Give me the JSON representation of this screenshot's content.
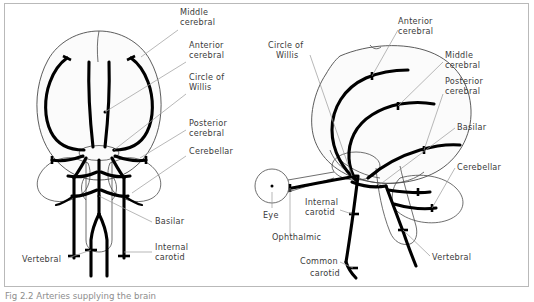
{
  "figure": {
    "caption": "Fig 2.2 Arteries supplying the brain",
    "frame_color": "#b9b9b9",
    "vessel_color": "#000000",
    "outline_color": "#4a4a4a",
    "leader_color": "#9a9a9a",
    "label_color": "#3a3a3a",
    "background": "#ffffff"
  },
  "left_diagram": {
    "name": "anterior-view-brain",
    "labels": [
      {
        "id": "middle-cerebral",
        "line1": "Middle",
        "line2": "cerebral"
      },
      {
        "id": "anterior-cerebral",
        "line1": "Anterior",
        "line2": "cerebral"
      },
      {
        "id": "circle-of-willis",
        "line1": "Circle of",
        "line2": "Willis"
      },
      {
        "id": "posterior-cerebral",
        "line1": "Posterior",
        "line2": "cerebral"
      },
      {
        "id": "cerebellar",
        "line1": "Cerebellar",
        "line2": ""
      },
      {
        "id": "basilar",
        "line1": "Basilar",
        "line2": ""
      },
      {
        "id": "internal-carotid",
        "line1": "Internal",
        "line2": "carotid"
      },
      {
        "id": "vertebral",
        "line1": "Vertebral",
        "line2": ""
      }
    ]
  },
  "right_diagram": {
    "name": "lateral-view-brain",
    "labels": [
      {
        "id": "anterior-cerebral",
        "line1": "Anterior",
        "line2": "cerebral"
      },
      {
        "id": "circle-of-willis",
        "line1": "Circle of",
        "line2": "Willis"
      },
      {
        "id": "middle-cerebral",
        "line1": "Middle",
        "line2": "cerebral"
      },
      {
        "id": "posterior-cerebral",
        "line1": "Posterior",
        "line2": "cerebral"
      },
      {
        "id": "basilar",
        "line1": "Basilar",
        "line2": ""
      },
      {
        "id": "cerebellar",
        "line1": "Cerebellar",
        "line2": ""
      },
      {
        "id": "eye",
        "line1": "Eye",
        "line2": ""
      },
      {
        "id": "internal-carotid",
        "line1": "Internal",
        "line2": "carotid"
      },
      {
        "id": "ophthalmic",
        "line1": "Ophthalmic",
        "line2": ""
      },
      {
        "id": "vertebral",
        "line1": "Vertebral",
        "line2": ""
      },
      {
        "id": "common-carotid",
        "line1": "Common",
        "line2": "carotid"
      }
    ]
  }
}
